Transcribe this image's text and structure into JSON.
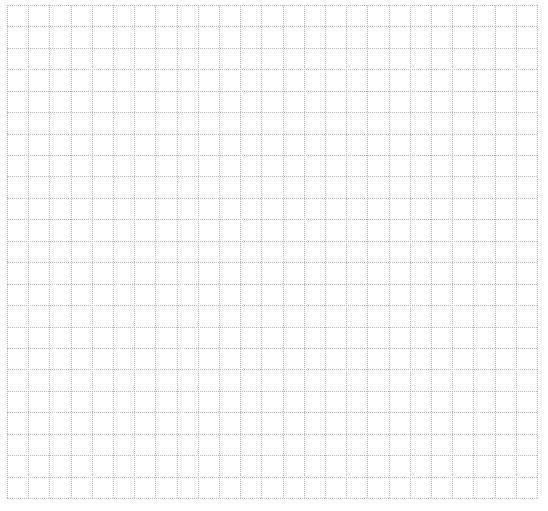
{
  "grid": {
    "columns": 25,
    "rows": 23,
    "line_color": "#b5b5b5",
    "background": "#ffffff",
    "line_style": "dotted"
  }
}
